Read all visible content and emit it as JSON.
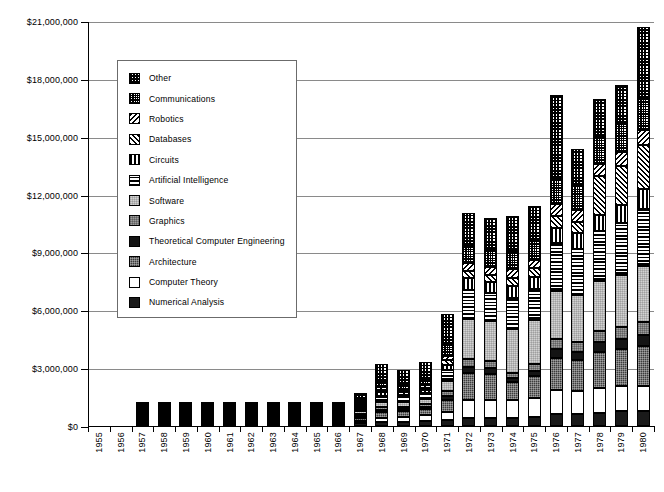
{
  "chart_data": {
    "type": "bar",
    "stacked": true,
    "title": "",
    "xlabel": "",
    "ylabel": "",
    "ylim": [
      0,
      21000000
    ],
    "ytick_values": [
      0,
      3000000,
      6000000,
      9000000,
      12000000,
      15000000,
      18000000,
      21000000
    ],
    "ytick_labels": [
      "$0",
      "$3,000,000",
      "$6,000,000",
      "$9,000,000",
      "$12,000,000",
      "$15,000,000",
      "$18,000,000",
      "$21,000,000"
    ],
    "grid": true,
    "legend_position": "upper-left-inside",
    "categories": [
      "1955",
      "1956",
      "1957",
      "1958",
      "1959",
      "1960",
      "1961",
      "1962",
      "1963",
      "1964",
      "1965",
      "1966",
      "1967",
      "1968",
      "1969",
      "1970",
      "1971",
      "1972",
      "1973",
      "1974",
      "1975",
      "1976",
      "1977",
      "1978",
      "1979",
      "1980"
    ],
    "series": [
      {
        "name": "Numerical Analysis",
        "pattern": "solid-black",
        "values": [
          0,
          0,
          30000,
          20000,
          25000,
          25000,
          40000,
          90000,
          70000,
          70000,
          80000,
          110000,
          150000,
          200000,
          230000,
          240000,
          300000,
          430000,
          430000,
          430000,
          450000,
          620000,
          620000,
          700000,
          790000,
          800000
        ]
      },
      {
        "name": "Computer Theory",
        "pattern": "white",
        "values": [
          0,
          0,
          20000,
          20000,
          25000,
          25000,
          40000,
          50000,
          60000,
          90000,
          80000,
          100000,
          130000,
          200000,
          260000,
          310000,
          420000,
          900000,
          900000,
          930000,
          980000,
          1230000,
          1200000,
          1250000,
          1270000,
          1300000
        ]
      },
      {
        "name": "Architecture",
        "pattern": "dark-gray-checker",
        "values": [
          0,
          0,
          20000,
          20000,
          20000,
          20000,
          60000,
          60000,
          90000,
          110000,
          90000,
          130000,
          180000,
          330000,
          280000,
          330000,
          640000,
          1400000,
          1350000,
          900000,
          1150000,
          1700000,
          1600000,
          1900000,
          1950000,
          2050000
        ]
      },
      {
        "name": "Theoretical Computer Engineering",
        "pattern": "solid-black",
        "values": [
          0,
          0,
          10000,
          10000,
          10000,
          10000,
          20000,
          20000,
          30000,
          30000,
          30000,
          40000,
          60000,
          110000,
          100000,
          110000,
          200000,
          330000,
          320000,
          230000,
          280000,
          430000,
          420000,
          500000,
          520000,
          560000
        ]
      },
      {
        "name": "Graphics",
        "pattern": "mid-gray-dither",
        "values": [
          0,
          0,
          10000,
          10000,
          10000,
          10000,
          20000,
          20000,
          30000,
          40000,
          30000,
          50000,
          70000,
          130000,
          120000,
          130000,
          240000,
          400000,
          390000,
          280000,
          340000,
          510000,
          500000,
          600000,
          620000,
          670000
        ]
      },
      {
        "name": "Software",
        "pattern": "light-gray-dither",
        "values": [
          0,
          0,
          20000,
          20000,
          20000,
          20000,
          40000,
          50000,
          70000,
          90000,
          70000,
          110000,
          160000,
          290000,
          260000,
          300000,
          560000,
          2100000,
          2050000,
          2250000,
          2300000,
          2500000,
          2450000,
          2550000,
          2700000,
          2900000
        ]
      },
      {
        "name": "Artificial Intelligence",
        "pattern": "horizontal-lines",
        "values": [
          0,
          0,
          20000,
          20000,
          20000,
          20000,
          40000,
          50000,
          70000,
          90000,
          70000,
          110000,
          160000,
          290000,
          260000,
          300000,
          560000,
          1500000,
          1450000,
          1600000,
          1600000,
          2500000,
          2400000,
          2600000,
          2700000,
          3000000
        ]
      },
      {
        "name": "Circuits",
        "pattern": "vertical-lines",
        "values": [
          0,
          0,
          10000,
          10000,
          10000,
          10000,
          20000,
          20000,
          30000,
          40000,
          30000,
          50000,
          70000,
          200000,
          120000,
          130000,
          240000,
          600000,
          580000,
          650000,
          650000,
          800000,
          800000,
          850000,
          900000,
          1000000
        ]
      },
      {
        "name": "Databases",
        "pattern": "diagonal-hatch-right",
        "values": [
          0,
          0,
          10000,
          10000,
          10000,
          10000,
          20000,
          20000,
          30000,
          40000,
          30000,
          50000,
          70000,
          130000,
          120000,
          130000,
          240000,
          400000,
          390000,
          430000,
          440000,
          600000,
          600000,
          2000000,
          2050000,
          2300000
        ]
      },
      {
        "name": "Robotics",
        "pattern": "diagonal-hatch-left",
        "values": [
          0,
          0,
          10000,
          10000,
          10000,
          10000,
          20000,
          20000,
          30000,
          40000,
          30000,
          50000,
          70000,
          130000,
          120000,
          130000,
          240000,
          400000,
          390000,
          430000,
          440000,
          600000,
          600000,
          650000,
          700000,
          780000
        ]
      },
      {
        "name": "Communications",
        "pattern": "fine-checker",
        "values": [
          0,
          0,
          20000,
          20000,
          20000,
          20000,
          40000,
          50000,
          70000,
          90000,
          70000,
          110000,
          160000,
          290000,
          260000,
          300000,
          560000,
          900000,
          880000,
          950000,
          980000,
          1300000,
          1280000,
          1400000,
          1450000,
          1600000
        ]
      },
      {
        "name": "Other",
        "pattern": "coarse-checker",
        "values": [
          0,
          0,
          120000,
          70000,
          80000,
          80000,
          120000,
          150000,
          190000,
          280000,
          190000,
          280000,
          420000,
          900000,
          800000,
          890000,
          1600000,
          1700000,
          1660000,
          1800000,
          1800000,
          4400000,
          1900000,
          1950000,
          2050000,
          3740000
        ]
      }
    ],
    "totals": [
      0,
      0,
      300000,
      240000,
      260000,
      260000,
      480000,
      600000,
      770000,
      1010000,
      800000,
      1190000,
      1700000,
      3200000,
      3070000,
      3330000,
      6000000,
      11060000,
      10790000,
      10880000,
      11410000,
      17190000,
      14770000,
      16950000,
      17900000,
      20700000
    ]
  },
  "legend": {
    "items": [
      {
        "label": "Other",
        "pattern": "coarse-checker"
      },
      {
        "label": "Communications",
        "pattern": "fine-checker"
      },
      {
        "label": "Robotics",
        "pattern": "diagonal-hatch-left"
      },
      {
        "label": "Databases",
        "pattern": "diagonal-hatch-right"
      },
      {
        "label": "Circuits",
        "pattern": "vertical-lines"
      },
      {
        "label": "Artificial Intelligence",
        "pattern": "horizontal-lines"
      },
      {
        "label": "Software",
        "pattern": "light-gray-dither"
      },
      {
        "label": "Graphics",
        "pattern": "mid-gray-dither"
      },
      {
        "label": "Theoretical Computer Engineering",
        "pattern": "solid-black"
      },
      {
        "label": "Architecture",
        "pattern": "dark-gray-checker"
      },
      {
        "label": "Computer Theory",
        "pattern": "white"
      },
      {
        "label": "Numerical Analysis",
        "pattern": "solid-black"
      }
    ]
  },
  "colors": {
    "axis": "#000000",
    "gridline": "#8a8a8a",
    "legend_border": "#6b6b6b",
    "background": "#ffffff"
  }
}
